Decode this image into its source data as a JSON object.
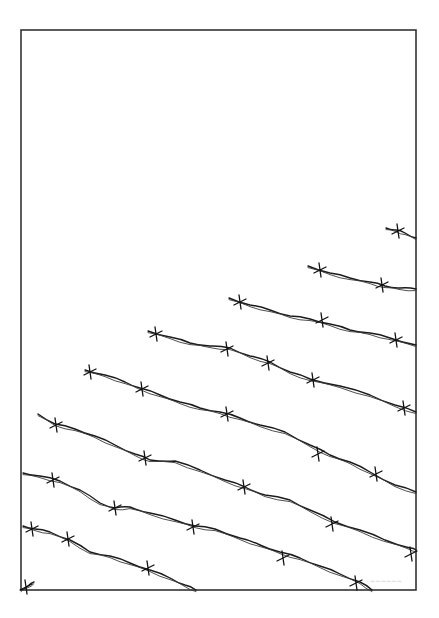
{
  "artwork": {
    "subject": "barbed wire strands illustration",
    "background": "#ffffff",
    "ink_color": "#1a1a1a",
    "frame": {
      "x": 21,
      "y": 30,
      "width": 395,
      "height": 560,
      "color": "#333333"
    },
    "signature": {
      "text": "~~~~~~",
      "x": 370,
      "y": 583,
      "color": "#b8b8b8"
    },
    "strands": [
      {
        "points": [
          [
            386,
            228
          ],
          [
            396,
            230
          ],
          [
            405,
            233
          ],
          [
            416,
            238
          ]
        ],
        "barbs": [
          [
            398,
            231
          ]
        ]
      },
      {
        "points": [
          [
            308,
            266
          ],
          [
            330,
            273
          ],
          [
            350,
            278
          ],
          [
            370,
            282
          ],
          [
            385,
            286
          ],
          [
            400,
            288
          ],
          [
            416,
            289
          ]
        ],
        "barbs": [
          [
            320,
            270
          ],
          [
            382,
            285
          ]
        ]
      },
      {
        "points": [
          [
            229,
            298
          ],
          [
            250,
            305
          ],
          [
            270,
            310
          ],
          [
            290,
            316
          ],
          [
            310,
            319
          ],
          [
            330,
            324
          ],
          [
            350,
            330
          ],
          [
            370,
            333
          ],
          [
            390,
            338
          ],
          [
            416,
            345
          ]
        ],
        "barbs": [
          [
            240,
            302
          ],
          [
            322,
            320
          ],
          [
            396,
            340
          ]
        ]
      },
      {
        "points": [
          [
            148,
            331
          ],
          [
            170,
            337
          ],
          [
            190,
            343
          ],
          [
            210,
            346
          ],
          [
            230,
            348
          ],
          [
            250,
            356
          ],
          [
            270,
            362
          ],
          [
            290,
            372
          ],
          [
            310,
            379
          ],
          [
            340,
            386
          ],
          [
            370,
            395
          ],
          [
            395,
            405
          ],
          [
            416,
            412
          ]
        ],
        "barbs": [
          [
            156,
            334
          ],
          [
            227,
            349
          ],
          [
            268,
            363
          ],
          [
            313,
            380
          ],
          [
            404,
            408
          ]
        ]
      },
      {
        "points": [
          [
            85,
            370
          ],
          [
            105,
            375
          ],
          [
            125,
            382
          ],
          [
            140,
            388
          ],
          [
            160,
            395
          ],
          [
            180,
            402
          ],
          [
            200,
            408
          ],
          [
            220,
            412
          ],
          [
            240,
            418
          ],
          [
            260,
            425
          ],
          [
            285,
            432
          ],
          [
            310,
            445
          ],
          [
            330,
            455
          ],
          [
            350,
            462
          ],
          [
            370,
            472
          ],
          [
            395,
            485
          ],
          [
            416,
            492
          ]
        ],
        "barbs": [
          [
            90,
            372
          ],
          [
            142,
            389
          ],
          [
            227,
            414
          ],
          [
            318,
            454
          ],
          [
            376,
            474
          ]
        ]
      },
      {
        "points": [
          [
            38,
            414
          ],
          [
            55,
            424
          ],
          [
            75,
            429
          ],
          [
            95,
            436
          ],
          [
            115,
            445
          ],
          [
            135,
            454
          ],
          [
            150,
            460
          ],
          [
            175,
            461
          ],
          [
            200,
            470
          ],
          [
            225,
            480
          ],
          [
            245,
            487
          ],
          [
            265,
            495
          ],
          [
            290,
            500
          ],
          [
            310,
            510
          ],
          [
            335,
            522
          ],
          [
            360,
            530
          ],
          [
            385,
            540
          ],
          [
            410,
            548
          ],
          [
            416,
            550
          ]
        ],
        "barbs": [
          [
            56,
            425
          ],
          [
            145,
            458
          ],
          [
            244,
            487
          ],
          [
            332,
            524
          ],
          [
            411,
            554
          ]
        ]
      },
      {
        "points": [
          [
            23,
            473
          ],
          [
            40,
            476
          ],
          [
            60,
            481
          ],
          [
            80,
            490
          ],
          [
            100,
            503
          ],
          [
            115,
            508
          ],
          [
            130,
            507
          ],
          [
            150,
            513
          ],
          [
            175,
            520
          ],
          [
            195,
            526
          ],
          [
            215,
            529
          ],
          [
            240,
            538
          ],
          [
            260,
            545
          ],
          [
            280,
            552
          ],
          [
            300,
            558
          ],
          [
            320,
            566
          ],
          [
            340,
            574
          ],
          [
            360,
            582
          ],
          [
            372,
            590
          ]
        ],
        "barbs": [
          [
            53,
            480
          ],
          [
            115,
            508
          ],
          [
            193,
            527
          ],
          [
            283,
            558
          ],
          [
            356,
            583
          ]
        ]
      },
      {
        "points": [
          [
            23,
            526
          ],
          [
            35,
            529
          ],
          [
            50,
            532
          ],
          [
            70,
            540
          ],
          [
            90,
            552
          ],
          [
            110,
            556
          ],
          [
            130,
            563
          ],
          [
            150,
            570
          ],
          [
            170,
            578
          ],
          [
            185,
            585
          ],
          [
            196,
            590
          ]
        ],
        "barbs": [
          [
            32,
            529
          ],
          [
            68,
            539
          ],
          [
            148,
            568
          ]
        ]
      },
      {
        "points": [
          [
            21,
            590
          ],
          [
            28,
            586
          ],
          [
            34,
            582
          ]
        ],
        "barbs": [
          [
            26,
            587
          ]
        ]
      }
    ]
  }
}
